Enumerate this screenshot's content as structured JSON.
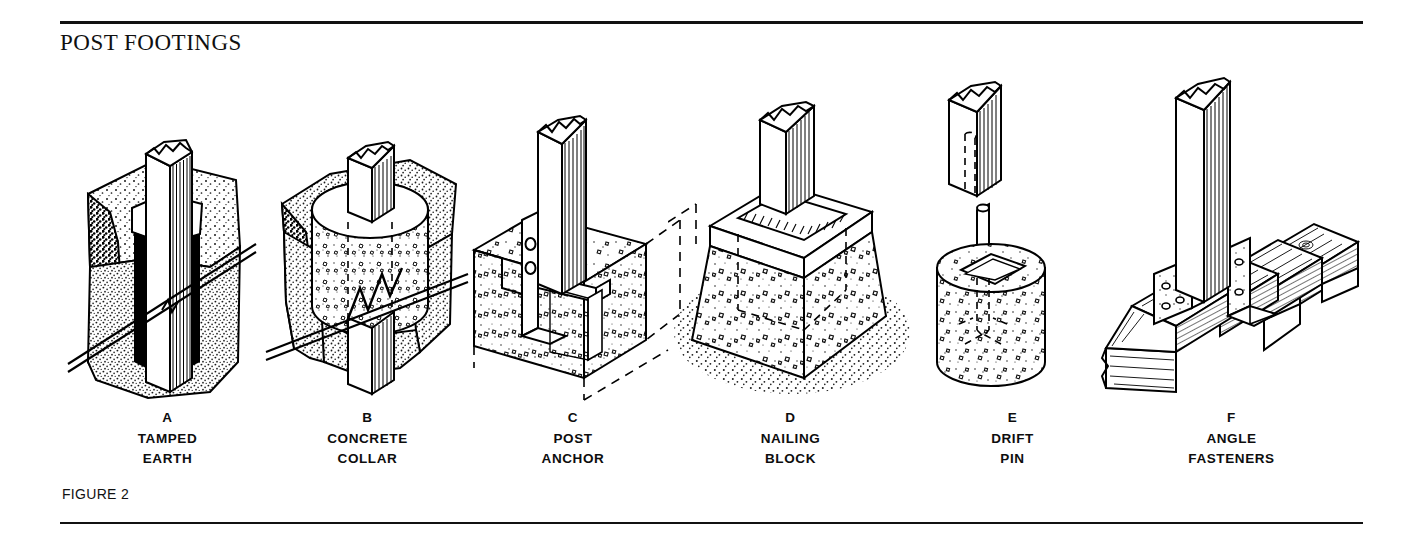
{
  "document": {
    "title": "POST FOOTINGS",
    "figure_label": "FIGURE 2",
    "background_color": "#ffffff",
    "ink_color": "#000000"
  },
  "figure": {
    "panels": [
      {
        "letter": "A",
        "name_line1": "TAMPED",
        "name_line2": "EARTH",
        "icon": "post-in-tamped-earth-hole"
      },
      {
        "letter": "B",
        "name_line1": "CONCRETE",
        "name_line2": "COLLAR",
        "icon": "post-with-concrete-collar"
      },
      {
        "letter": "C",
        "name_line1": "POST",
        "name_line2": "ANCHOR",
        "icon": "post-anchor-metal-strap-in-concrete-block"
      },
      {
        "letter": "D",
        "name_line1": "NAILING",
        "name_line2": "BLOCK",
        "icon": "tapered-concrete-pier-with-nailing-block"
      },
      {
        "letter": "E",
        "name_line1": "DRIFT",
        "name_line2": "PIN",
        "icon": "concrete-cylinder-with-drift-pin-exploded"
      },
      {
        "letter": "F",
        "name_line1": "ANGLE",
        "name_line2": "FASTENERS",
        "icon": "post-on-wood-deck-with-angle-brackets"
      }
    ]
  }
}
